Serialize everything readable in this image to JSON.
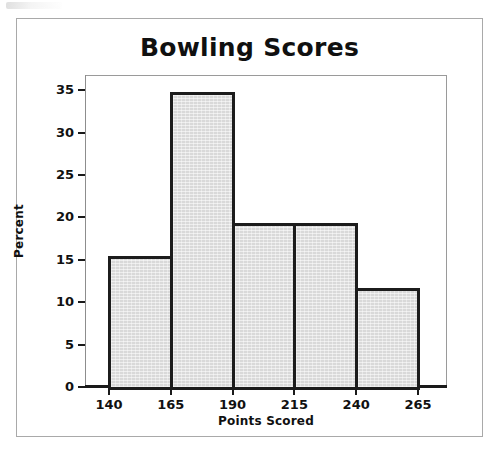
{
  "figure": {
    "title": "Bowling Scores"
  },
  "chart_data": {
    "type": "bar",
    "title": "Bowling Scores",
    "xlabel": "Points Scored",
    "ylabel": "Percent",
    "categories": [
      "140-165",
      "165-190",
      "190-215",
      "215-240",
      "240-265"
    ],
    "bin_edges": [
      140,
      165,
      190,
      215,
      240,
      265
    ],
    "values": [
      15.4,
      34.8,
      19.4,
      19.4,
      11.7
    ],
    "xtick_labels": [
      "140",
      "165",
      "190",
      "215",
      "240",
      "265"
    ],
    "ytick_labels": [
      "0",
      "5",
      "10",
      "15",
      "20",
      "25",
      "30",
      "35"
    ],
    "yticks": [
      0,
      5,
      10,
      15,
      20,
      25,
      30,
      35
    ],
    "ylim": [
      0,
      36.8
    ],
    "xlim": [
      140,
      265
    ],
    "grid": false,
    "legend": false,
    "bar_fill_color": "#d9d9d9",
    "bar_edge_color": "#1c1c1c",
    "background_color": "#ffffff"
  }
}
